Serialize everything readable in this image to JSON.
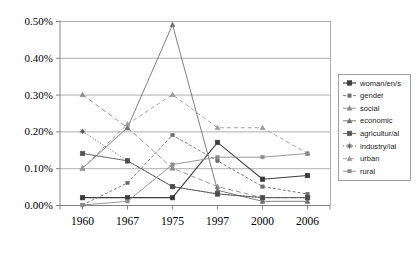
{
  "chart_data": {
    "type": "line",
    "title": "",
    "xlabel": "",
    "ylabel": "",
    "categories": [
      "1960",
      "1967",
      "1975",
      "1997",
      "2000",
      "2006"
    ],
    "ylim": [
      0.0,
      0.5
    ],
    "ytick_labels": [
      "0.50%",
      "0.40%",
      "0.30%",
      "0.20%",
      "0.10%",
      "0.00%"
    ],
    "ytick_values": [
      0.5,
      0.4,
      0.3,
      0.2,
      0.1,
      0.0
    ],
    "grid": true,
    "legend_position": "right",
    "units": "percent",
    "series": [
      {
        "name": "woman/en/s",
        "values": [
          0.02,
          0.02,
          0.02,
          0.17,
          0.07,
          0.08
        ],
        "color": "#3a3a3a",
        "dash": "none",
        "marker": "square-filled",
        "width": 1.1
      },
      {
        "name": "gender",
        "values": [
          0.0,
          0.06,
          0.19,
          0.12,
          0.05,
          0.03
        ],
        "color": "#6e6e6e",
        "dash": "3,2",
        "marker": "square-small",
        "width": 0.9
      },
      {
        "name": "social",
        "values": [
          0.3,
          0.21,
          0.1,
          0.05,
          0.02,
          0.02
        ],
        "color": "#8a8a8a",
        "dash": "5,3",
        "marker": "triangle",
        "width": 0.9
      },
      {
        "name": "economic",
        "values": [
          0.1,
          0.21,
          0.49,
          0.04,
          0.01,
          0.01
        ],
        "color": "#707070",
        "dash": "none",
        "marker": "triangle",
        "width": 0.9
      },
      {
        "name": "agricultur/al",
        "values": [
          0.14,
          0.12,
          0.05,
          0.03,
          0.02,
          0.02
        ],
        "color": "#555555",
        "dash": "none",
        "marker": "square-filled",
        "width": 0.9
      },
      {
        "name": "industry/ial",
        "values": [
          0.2,
          0.12,
          0.05,
          0.03,
          0.02,
          0.02
        ],
        "color": "#4a4a4a",
        "dash": "1,2",
        "marker": "star",
        "width": 0.9
      },
      {
        "name": "urban",
        "values": [
          0.1,
          0.22,
          0.3,
          0.21,
          0.21,
          0.14
        ],
        "color": "#9a9a9a",
        "dash": "4,3",
        "marker": "triangle",
        "width": 0.9
      },
      {
        "name": "rural",
        "values": [
          0.0,
          0.01,
          0.11,
          0.13,
          0.13,
          0.14
        ],
        "color": "#8c8c8c",
        "dash": "none",
        "marker": "square-small",
        "width": 0.9
      }
    ]
  },
  "legend": {
    "items": [
      {
        "label": "woman/en/s"
      },
      {
        "label": "gender"
      },
      {
        "label": "social"
      },
      {
        "label": "economic"
      },
      {
        "label": "agricultur/al"
      },
      {
        "label": "industry/ial"
      },
      {
        "label": "urban"
      },
      {
        "label": "rural"
      }
    ]
  }
}
